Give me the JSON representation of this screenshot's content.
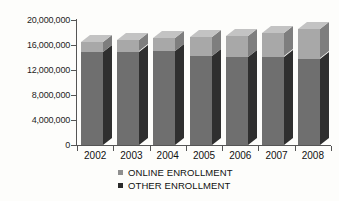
{
  "chart_data": {
    "type": "bar",
    "subtype": "stacked-column-3d",
    "title": "",
    "xlabel": "",
    "ylabel": "",
    "categories": [
      "2002",
      "2003",
      "2004",
      "2005",
      "2006",
      "2007",
      "2008"
    ],
    "series": [
      {
        "name": "OTHER ENROLLMENT",
        "color": "#6f6f6f",
        "values": [
          14900000,
          14950000,
          15000000,
          14200000,
          14150000,
          14150000,
          13800000
        ]
      },
      {
        "name": "ONLINE ENROLLMENT",
        "color": "#a8a8a8",
        "values": [
          1600000,
          1800000,
          2100000,
          3100000,
          3350000,
          3750000,
          4700000
        ]
      }
    ],
    "totals": [
      16500000,
      16750000,
      17100000,
      17300000,
      17500000,
      17900000,
      18500000
    ],
    "ylim": [
      0,
      20000000
    ],
    "yticks": [
      0,
      4000000,
      8000000,
      12000000,
      16000000,
      20000000
    ],
    "ytick_labels": [
      "0",
      "4,000,000",
      "8,000,000",
      "12,000,000",
      "16,000,000",
      "20,000,000"
    ],
    "grid": false,
    "legend_position": "bottom-center",
    "legend": [
      {
        "label": "ONLINE ENROLLMENT",
        "color": "#8f8f8f",
        "marker": "square"
      },
      {
        "label": "OTHER ENROLLMENT",
        "color": "#2b2b2b",
        "marker": "square"
      }
    ]
  },
  "style": {
    "background": "#fdfdfb",
    "axis_color": "#555555",
    "text_color": "#111111",
    "online_face": "#a8a8a8",
    "online_side": "#7e7e7e",
    "online_top": "#c3c3c3",
    "other_face": "#6f6f6f",
    "other_side": "#2f2f2f",
    "other_top": "#8a8a8a"
  }
}
